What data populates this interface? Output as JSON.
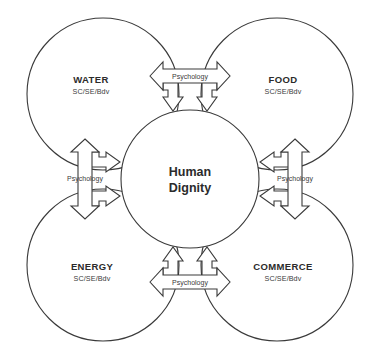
{
  "diagram": {
    "center": {
      "line1": "Human",
      "line2": "Dignity"
    },
    "nodes": [
      {
        "id": "water",
        "label": "WATER",
        "sublabel": "SC/SE/Bdv",
        "cx": 103,
        "cy": 94,
        "r": 76
      },
      {
        "id": "food",
        "label": "FOOD",
        "sublabel": "SC/SE/Bdv",
        "cx": 277,
        "cy": 94,
        "r": 76
      },
      {
        "id": "energy",
        "label": "ENERGY",
        "sublabel": "SC/SE/Bdv",
        "cx": 103,
        "cy": 265,
        "r": 76
      },
      {
        "id": "commerce",
        "label": "COMMERCE",
        "sublabel": "SC/SE/Bdv",
        "cx": 277,
        "cy": 265,
        "r": 76
      }
    ],
    "connectors": [
      {
        "id": "top",
        "label": "Psychology"
      },
      {
        "id": "left",
        "label": "Psychology"
      },
      {
        "id": "right",
        "label": "Psychology"
      },
      {
        "id": "bottom",
        "label": "Psychology"
      }
    ],
    "colors": {
      "stroke": "#3a3a3a",
      "text": "#2b2b2b",
      "background": "#ffffff"
    }
  }
}
